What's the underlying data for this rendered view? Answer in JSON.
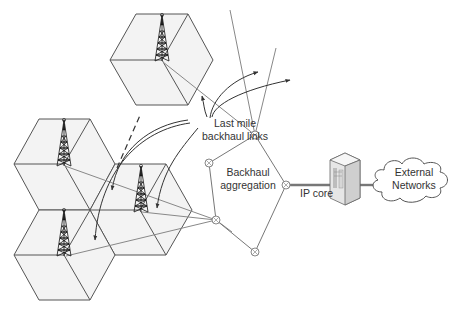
{
  "diagram": {
    "labels": {
      "last_mile_line1": "Last mile",
      "last_mile_line2": "backhaul links",
      "aggregation_line1": "Backhaul",
      "aggregation_line2": "aggregation",
      "ip_core": "IP core",
      "external_line1": "External",
      "external_line2": "Networks"
    },
    "cells": [
      {
        "id": "cell-top",
        "center": [
          162,
          60
        ]
      },
      {
        "id": "cell-left-mid",
        "center": [
          64,
          164
        ]
      },
      {
        "id": "cell-right-mid",
        "center": [
          140,
          210
        ]
      },
      {
        "id": "cell-bottom-left",
        "center": [
          64,
          255
        ]
      }
    ],
    "aggregation_nodes": [
      {
        "id": "node-a",
        "pos": [
          255,
          135
        ]
      },
      {
        "id": "node-b",
        "pos": [
          209,
          163
        ]
      },
      {
        "id": "node-c",
        "pos": [
          216,
          220
        ]
      },
      {
        "id": "node-d",
        "pos": [
          286,
          185
        ]
      },
      {
        "id": "node-e",
        "pos": [
          255,
          252
        ]
      }
    ],
    "colors": {
      "cell_fill": "#f3f3f3",
      "cell_stroke": "#555555",
      "link": "#888888",
      "text": "#333333"
    }
  }
}
